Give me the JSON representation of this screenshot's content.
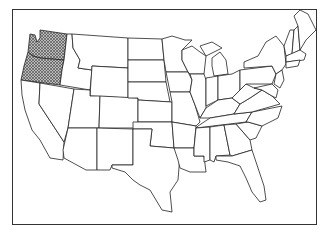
{
  "map": {
    "title": "United States map with highlighted states",
    "region": "Contiguous United States",
    "highlighted_states": [
      "Washington",
      "Oregon"
    ],
    "highlight_style": "crosshatch",
    "colors": {
      "outline": "#222222",
      "fill": "#ffffff",
      "hatch": "#444444",
      "background": "#ffffff"
    },
    "legend": null
  }
}
